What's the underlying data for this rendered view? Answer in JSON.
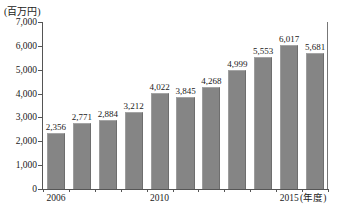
{
  "chart_data": {
    "type": "bar",
    "title": "",
    "subtitle": "",
    "unit_label": "(百万円)",
    "xlabel": "(年度)",
    "ylabel": "",
    "categories": [
      "2006",
      "2007",
      "2008",
      "2009",
      "2010",
      "2011",
      "2012",
      "2013",
      "2014",
      "2015",
      "2016"
    ],
    "values": [
      2356,
      2771,
      2884,
      3212,
      4022,
      3845,
      4268,
      4999,
      5553,
      6017,
      5681
    ],
    "value_labels": [
      "2,356",
      "2,771",
      "2,884",
      "3,212",
      "4,022",
      "3,845",
      "4,268",
      "4,999",
      "5,553",
      "6,017",
      "5,681"
    ],
    "ylim": [
      0,
      7000
    ],
    "ytick_values": [
      0,
      1000,
      2000,
      3000,
      4000,
      5000,
      6000,
      7000
    ],
    "ytick_labels": [
      "0",
      "1,000",
      "2,000",
      "3,000",
      "4,000",
      "5,000",
      "6,000",
      "7,000"
    ],
    "xtick_labels_shown": [
      {
        "index": 0,
        "label": "2006"
      },
      {
        "index": 4,
        "label": "2010"
      },
      {
        "index": 9,
        "label": "2015"
      }
    ],
    "grid": false,
    "legend": null,
    "bar_color": "#858585",
    "axis_color": "#555555"
  },
  "footnote": ""
}
